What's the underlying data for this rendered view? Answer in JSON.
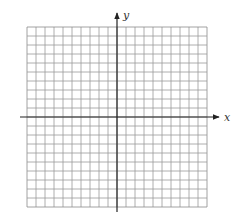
{
  "diagram": {
    "type": "coordinate-grid",
    "x_axis_label": "x",
    "y_axis_label": "y",
    "grid": {
      "columns": 20,
      "rows": 20,
      "left": 27,
      "top": 27,
      "cell": 9
    },
    "origin": {
      "px": 117,
      "py": 117
    },
    "colors": {
      "grid_line": "#9a9a9a",
      "grid_border": "#8a8a8a",
      "axis": "#222222",
      "background": "#ffffff"
    }
  }
}
